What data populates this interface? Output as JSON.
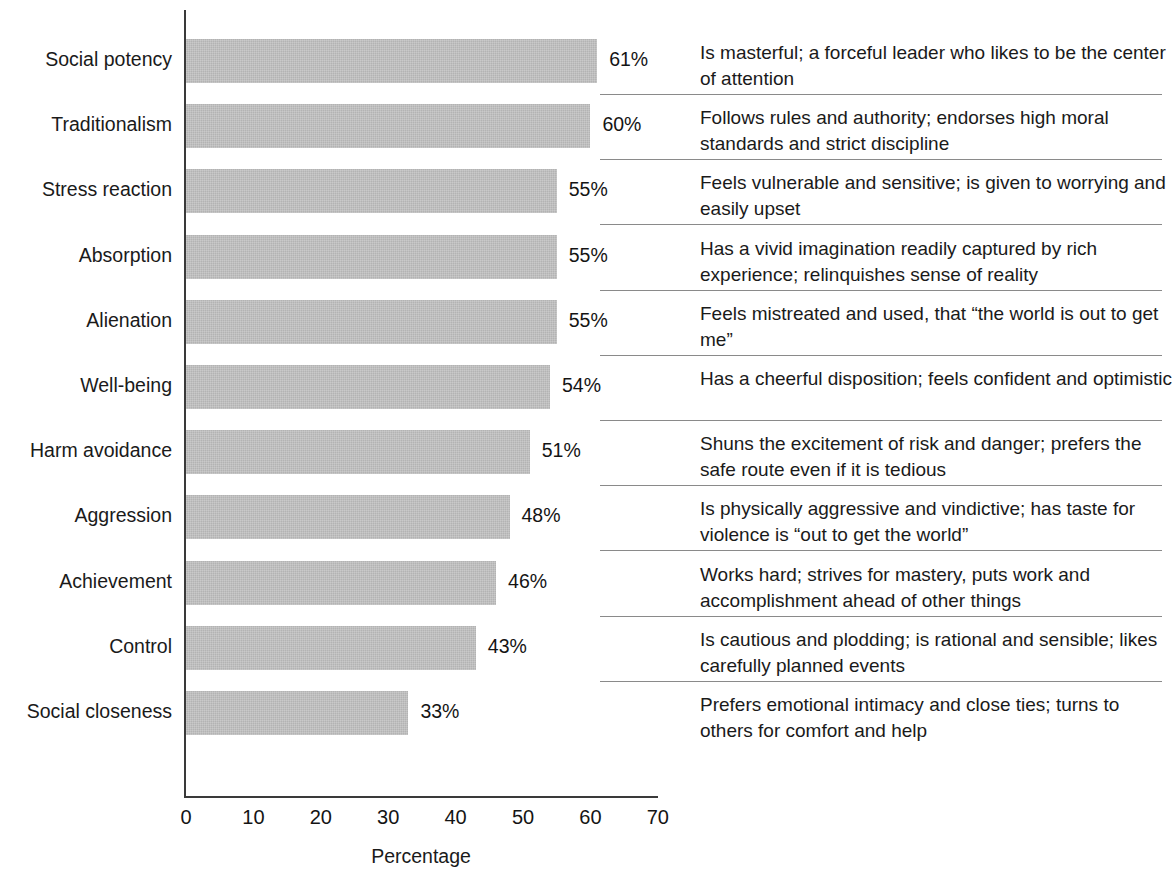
{
  "chart_data": {
    "type": "bar",
    "orientation": "horizontal",
    "title": "",
    "xlabel": "Percentage",
    "ylabel": "",
    "xlim": [
      0,
      70
    ],
    "xticks": [
      "0",
      "10",
      "20",
      "30",
      "40",
      "50",
      "60",
      "70"
    ],
    "grid": false,
    "legend": "none",
    "bar_color": "#b3b3b3",
    "axis_color": "#3a3a3a",
    "categories": [
      "Social potency",
      "Traditionalism",
      "Stress reaction",
      "Absorption",
      "Alienation",
      "Well-being",
      "Harm avoidance",
      "Aggression",
      "Achievement",
      "Control",
      "Social closeness"
    ],
    "values": [
      61,
      60,
      55,
      55,
      55,
      54,
      51,
      48,
      46,
      43,
      33
    ],
    "value_labels": [
      "61%",
      "60%",
      "55%",
      "55%",
      "55%",
      "54%",
      "51%",
      "48%",
      "46%",
      "43%",
      "33%"
    ],
    "descriptions": [
      "Is masterful; a forceful leader who likes to be the center of attention",
      "Follows rules and authority; endorses high moral standards and strict discipline",
      "Feels vulnerable and sensitive; is given to worrying and easily upset",
      "Has a vivid imagination readily captured by rich experience; relinquishes sense of reality",
      "Feels mistreated and used, that “the world is out to get me”",
      "Has a cheerful disposition; feels confident and optimistic",
      "Shuns the excitement of risk and danger; prefers the safe route even if it is tedious",
      "Is physically aggressive and vindictive; has taste for violence is “out to get the world”",
      "Works hard; strives for mastery, puts work and accomplishment ahead of other things",
      "Is cautious and plodding; is rational and sensible; likes carefully planned events",
      "Prefers emotional intimacy and close ties; turns to others for comfort and help"
    ]
  }
}
